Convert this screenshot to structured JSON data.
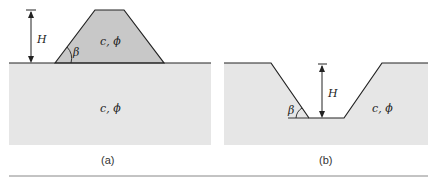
{
  "figure": {
    "panel_a": {
      "caption": "(a)",
      "height_label": "H",
      "angle_label": "β",
      "embankment_label": "c, ϕ",
      "foundation_label": "c, ϕ"
    },
    "panel_b": {
      "caption": "(b)",
      "height_label": "H",
      "angle_label": "β",
      "soil_label": "c, ϕ"
    },
    "colors": {
      "embankment": "#c8c8c8",
      "ground": "#e6e6e6",
      "line": "#222222"
    }
  }
}
